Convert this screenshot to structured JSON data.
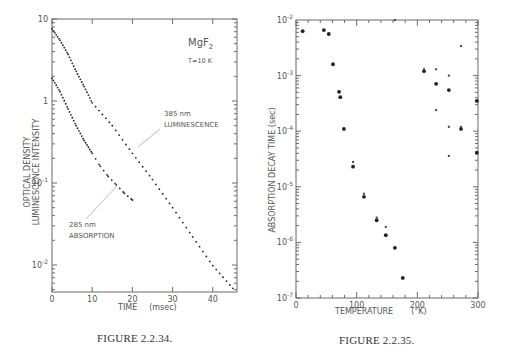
{
  "chart_data": [
    {
      "type": "scatter",
      "figure_label": "FIGURE 2.2.34.",
      "title": "",
      "annotations": [
        "MgF2",
        "T=10 K",
        "385 nm LUMINESCENCE",
        "285 nm ABSORPTION"
      ],
      "xlabel": "TIME (msec)",
      "ylabel": [
        "OPTICAL DENSITY",
        "LUMINESCENCE INTENSITY"
      ],
      "yscale": "log",
      "xlim": [
        0,
        46
      ],
      "ylim": [
        0.005,
        10
      ],
      "xticks": [
        0,
        10,
        20,
        30,
        40
      ],
      "yticks": [
        {
          "value": 10,
          "label": "10"
        },
        {
          "value": 1,
          "label": "1"
        },
        {
          "value": 0.1,
          "label": "10-1"
        },
        {
          "value": 0.01,
          "label": "10-2"
        }
      ],
      "grid": false,
      "series": [
        {
          "name": "385 nm LUMINESCENCE",
          "x": [
            0,
            2,
            4,
            6,
            8,
            10,
            15,
            20,
            25,
            30,
            35,
            40,
            45
          ],
          "values": [
            7.6,
            5.5,
            3.7,
            2.3,
            1.5,
            0.95,
            0.5,
            0.23,
            0.11,
            0.05,
            0.022,
            0.0098,
            0.0052
          ]
        },
        {
          "name": "285 nm ABSORPTION",
          "x": [
            0,
            2,
            4,
            6,
            8,
            10,
            12,
            14,
            16,
            18,
            20
          ],
          "values": [
            1.9,
            1.3,
            0.8,
            0.5,
            0.33,
            0.23,
            0.16,
            0.12,
            0.095,
            0.075,
            0.062
          ]
        }
      ]
    },
    {
      "type": "scatter",
      "figure_label": "FIGURE 2.2.35.",
      "title": "",
      "xlabel": "TEMPERATURE (°K)",
      "ylabel": "ABSORPTION DECAY TIME (sec)",
      "yscale": "log",
      "xlim": [
        0,
        300
      ],
      "ylim": [
        1e-07,
        0.01
      ],
      "xticks": [
        0,
        100,
        200,
        300
      ],
      "yticks": [
        {
          "value": 0.01,
          "label": "10-2"
        },
        {
          "value": 0.001,
          "label": "10-3"
        },
        {
          "value": 0.0001,
          "label": "10-4"
        },
        {
          "value": 1e-05,
          "label": "10-5"
        },
        {
          "value": 1e-06,
          "label": "10-6"
        },
        {
          "value": 1e-07,
          "label": "10-7"
        }
      ],
      "grid": false,
      "series": [
        {
          "name": "large dots",
          "x": [
            11,
            46,
            54,
            61,
            71,
            73,
            79,
            94,
            112,
            133,
            148,
            163,
            176,
            211,
            231,
            252,
            272,
            298,
            298
          ],
          "values": [
            0.0063,
            0.0066,
            0.0056,
            0.0016,
            0.00051,
            0.00041,
            0.00011,
            2.3e-05,
            6.6e-06,
            2.5e-06,
            1.35e-06,
            8e-07,
            2.3e-07,
            0.0012,
            0.00071,
            0.00055,
            0.00011,
            0.00035,
            4.1e-05
          ]
        },
        {
          "name": "small marks",
          "x": [
            163,
            211,
            231,
            252,
            272,
            231,
            252,
            272,
            252,
            148,
            94,
            112,
            133
          ],
          "values": [
            0.01,
            0.0013,
            0.0013,
            0.001,
            0.0034,
            0.00024,
            0.00012,
            0.00012,
            3.6e-05,
            1.9e-06,
            2.8e-05,
            7.5e-06,
            2.8e-06
          ]
        }
      ]
    }
  ],
  "captions": {
    "left": "FIGURE 2.2.34.",
    "right": "FIGURE 2.2.35."
  },
  "left_plot": {
    "ylabel_outer": "OPTICAL DENSITY",
    "ylabel_inner": "LUMINESCENCE INTENSITY",
    "xlabel_main": "TIME",
    "xlabel_unit": "(msec)",
    "material": "MgF",
    "material_sub": "2",
    "temperature": "T=10  K",
    "lum_label_1": "385  nm",
    "lum_label_2": "LUMINESCENCE",
    "abs_label_1": "285  nm",
    "abs_label_2": "ABSORPTION"
  },
  "right_plot": {
    "ylabel_words": [
      "ABSORPTION",
      "DECAY",
      "TIME",
      "(sec)"
    ],
    "xlabel_main": "TEMPERATURE",
    "xlabel_unit": "(°K)"
  },
  "colors": {
    "axis": "#6b6b6b",
    "points": "#222222",
    "text": "#555555"
  }
}
